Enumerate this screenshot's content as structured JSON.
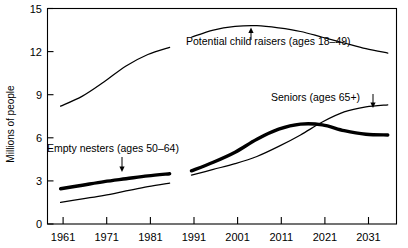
{
  "chart_data": {
    "type": "line",
    "title": "",
    "subtitle": "",
    "xlabel": "",
    "ylabel": "Millions of people",
    "xlim": [
      1958,
      2038
    ],
    "ylim": [
      0,
      15
    ],
    "yticks": [
      0,
      3,
      6,
      9,
      12,
      15
    ],
    "xticks": [
      1961,
      1971,
      1981,
      1991,
      2001,
      2011,
      2021,
      2031
    ],
    "grid": false,
    "legend": "none (inline annotations)",
    "annotations": [
      {
        "name": "potential-child-raisers",
        "text": "Potential child raisers (ages 18–49)",
        "arrow": "up"
      },
      {
        "name": "empty-nesters",
        "text": "Empty nesters (ages 50–64)",
        "arrow": "down"
      },
      {
        "name": "seniors",
        "text": "Seniors (ages 65+)",
        "arrow": "down"
      }
    ],
    "note": "Two segments per series: historical 1961-1986 and projected 1991-2036, separated by a gap.",
    "series": [
      {
        "name": "Potential child raisers (ages 18-49)",
        "style": "thin",
        "segments": [
          {
            "label": "historical",
            "x": [
              1961,
              1966,
              1971,
              1976,
              1981,
              1986
            ],
            "y": [
              8.2,
              8.9,
              9.9,
              11.0,
              11.8,
              12.3
            ]
          },
          {
            "label": "projected",
            "x": [
              1991,
              1996,
              2001,
              2006,
              2011,
              2016,
              2021,
              2026,
              2031,
              2036
            ],
            "y": [
              13.0,
              13.5,
              13.75,
              13.8,
              13.65,
              13.4,
              13.0,
              12.6,
              12.2,
              11.9
            ]
          }
        ]
      },
      {
        "name": "Empty nesters (ages 50-64)",
        "style": "thick",
        "segments": [
          {
            "label": "historical",
            "x": [
              1961,
              1966,
              1971,
              1976,
              1981,
              1986
            ],
            "y": [
              2.45,
              2.7,
              2.95,
              3.15,
              3.35,
              3.5
            ]
          },
          {
            "label": "projected",
            "x": [
              1991,
              1996,
              2001,
              2006,
              2011,
              2016,
              2021,
              2026,
              2031,
              2036
            ],
            "y": [
              3.7,
              4.3,
              5.0,
              5.9,
              6.6,
              6.95,
              6.9,
              6.5,
              6.25,
              6.2
            ]
          }
        ]
      },
      {
        "name": "Seniors (ages 65+)",
        "style": "thin",
        "segments": [
          {
            "label": "historical",
            "x": [
              1961,
              1966,
              1971,
              1976,
              1981,
              1986
            ],
            "y": [
              1.5,
              1.75,
              2.0,
              2.3,
              2.6,
              2.85
            ]
          },
          {
            "label": "projected",
            "x": [
              1991,
              1996,
              2001,
              2006,
              2011,
              2016,
              2021,
              2026,
              2031,
              2036
            ],
            "y": [
              3.4,
              3.8,
              4.2,
              4.7,
              5.4,
              6.2,
              7.1,
              7.8,
              8.15,
              8.3
            ]
          }
        ]
      }
    ]
  },
  "axes": {
    "y_title": "Millions of people",
    "y_tick_labels": [
      "0",
      "3",
      "6",
      "9",
      "12",
      "15"
    ],
    "x_tick_labels": [
      "1961",
      "1971",
      "1981",
      "1991",
      "2001",
      "2011",
      "2021",
      "2031"
    ]
  },
  "labels": {
    "potential_child_raisers": "Potential child raisers (ages 18–49)",
    "empty_nesters": "Empty nesters (ages 50–64)",
    "seniors": "Seniors (ages 65+)"
  },
  "colors": {
    "ink": "#000000",
    "background": "#ffffff"
  }
}
